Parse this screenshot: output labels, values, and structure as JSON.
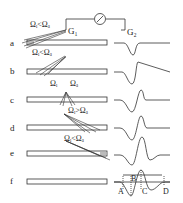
{
  "galvanometer": {
    "g1": "G₁",
    "g2": "G₂"
  },
  "rows": [
    {
      "label": "a",
      "annotation": "Ωᵢ<Ωₐ"
    },
    {
      "label": "b",
      "annotation": "Ωᵢ<Ωₐ"
    },
    {
      "label": "c",
      "annotation_left": "Ωᵢ",
      "annotation_right": "Ωₐ"
    },
    {
      "label": "d",
      "annotation": "Ωᵢ>Ωₐ"
    },
    {
      "label": "e",
      "annotation": "Ωᵢ<Ωₐ"
    },
    {
      "label": "f",
      "annotation": ""
    }
  ],
  "points": {
    "a": "A",
    "b": "B",
    "c": "C",
    "d": "D"
  },
  "colors": {
    "stroke": "#333333",
    "shade": "#bbbbbb"
  }
}
